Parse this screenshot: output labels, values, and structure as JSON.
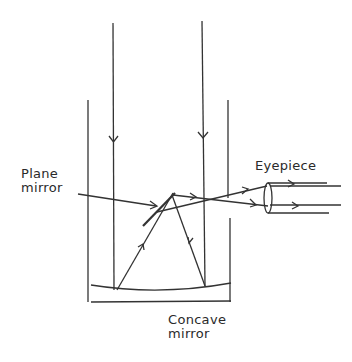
{
  "diagram": {
    "labels": {
      "plane_mirror_line1": "Plane",
      "plane_mirror_line2": "mirror",
      "eyepiece": "Eyepiece",
      "concave_mirror_line1": "Concave",
      "concave_mirror_line2": "mirror"
    },
    "colors": {
      "stroke": "#333333",
      "background": "#ffffff"
    },
    "components": [
      "tube",
      "incoming-rays",
      "concave-mirror",
      "plane-mirror",
      "reflected-rays",
      "eyepiece-lens",
      "eyepiece-tube"
    ]
  }
}
